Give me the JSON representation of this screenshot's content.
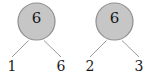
{
  "canvas": {
    "width": 150,
    "height": 79,
    "background": "#ffffff"
  },
  "style": {
    "node_fill": "#c6c6c6",
    "node_stroke": "#8f8f8f",
    "edge_color": "#9a9a9a",
    "text_color": "#17171a"
  },
  "diagram": {
    "type": "factor-tree",
    "trees": [
      {
        "id": "tree-0",
        "root": {
          "label": "6",
          "shape": "circle",
          "fill": "#c6c6c6",
          "stroke": "#8f8f8f"
        },
        "leaves": [
          {
            "label": "1",
            "position": "left"
          },
          {
            "label": "6",
            "position": "right"
          }
        ]
      },
      {
        "id": "tree-1",
        "root": {
          "label": "6",
          "shape": "circle",
          "fill": "#c6c6c6",
          "stroke": "#8f8f8f"
        },
        "leaves": [
          {
            "label": "2",
            "position": "left"
          },
          {
            "label": "3",
            "position": "right"
          }
        ]
      }
    ]
  }
}
